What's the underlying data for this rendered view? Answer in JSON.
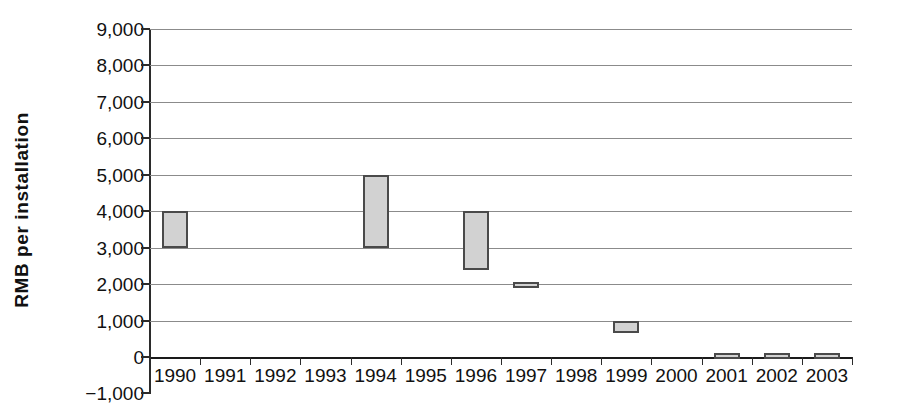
{
  "chart_data": {
    "type": "bar",
    "title": "",
    "subtitle": "",
    "xlabel": "",
    "ylabel": "RMB per installation",
    "categories": [
      "1990",
      "1991",
      "1992",
      "1993",
      "1994",
      "1995",
      "1996",
      "1997",
      "1998",
      "1999",
      "2000",
      "2001",
      "2002",
      "2003"
    ],
    "series": [
      {
        "name": "RMB per installation range",
        "bars": [
          {
            "category": "1990",
            "low": 3000,
            "high": 4000
          },
          {
            "category": "1991",
            "low": null,
            "high": null
          },
          {
            "category": "1992",
            "low": null,
            "high": null
          },
          {
            "category": "1993",
            "low": null,
            "high": null
          },
          {
            "category": "1994",
            "low": 3000,
            "high": 5000
          },
          {
            "category": "1995",
            "low": null,
            "high": null
          },
          {
            "category": "1996",
            "low": 2400,
            "high": 4000
          },
          {
            "category": "1997",
            "low": 1900,
            "high": 2050
          },
          {
            "category": "1998",
            "low": null,
            "high": null
          },
          {
            "category": "1999",
            "low": 650,
            "high": 1000
          },
          {
            "category": "2000",
            "low": null,
            "high": null
          },
          {
            "category": "2001",
            "low": -60,
            "high": 110
          },
          {
            "category": "2002",
            "low": -60,
            "high": 110
          },
          {
            "category": "2003",
            "low": -60,
            "high": 110
          }
        ]
      }
    ],
    "ytick_labels": [
      "9,000",
      "8,000",
      "7,000",
      "6,000",
      "5,000",
      "4,000",
      "3,000",
      "2,000",
      "1,000",
      "0",
      "−1,000"
    ],
    "ytick_values": [
      9000,
      8000,
      7000,
      6000,
      5000,
      4000,
      3000,
      2000,
      1000,
      0,
      -1000
    ],
    "ylim": [
      -1000,
      9000
    ],
    "grid": true,
    "legend": "none",
    "colors": {
      "bar_fill": "#d2d2d2",
      "bar_border": "#4a4a4a",
      "gridline": "#8b8b8b",
      "axis": "#2b2b2b",
      "text": "#111111",
      "background": "#ffffff"
    }
  }
}
